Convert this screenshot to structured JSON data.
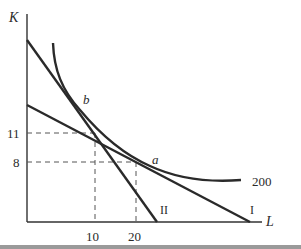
{
  "diagram": {
    "axes": {
      "y_label": "K",
      "x_label": "L"
    },
    "ticks": {
      "y": [
        {
          "label": "11",
          "value": 11
        },
        {
          "label": "8",
          "value": 8
        }
      ],
      "x": [
        {
          "label": "10",
          "value": 10
        },
        {
          "label": "20",
          "value": 20
        }
      ]
    },
    "points": {
      "a": {
        "label": "a",
        "L": 20,
        "K": 8
      },
      "b": {
        "label": "b",
        "L": 10,
        "K": 11
      }
    },
    "isoquant": {
      "label": "200"
    },
    "lines": {
      "I": {
        "label": "I"
      },
      "II": {
        "label": "II"
      }
    },
    "colors": {
      "curve": "#2a2a2a",
      "axis": "#333333",
      "dashed": "#555555",
      "bottom_bar": "#9a9a9a"
    }
  }
}
